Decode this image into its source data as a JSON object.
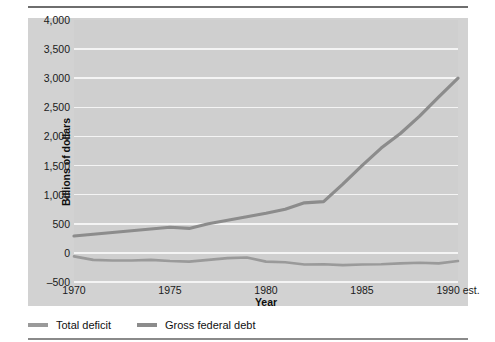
{
  "figure": {
    "background": "#ffffff",
    "panel_color": "#d2d2d2",
    "plot_color": "#cfcfcf",
    "gridline_color": "#f4f4f4",
    "rule_color": "#6e6e6e"
  },
  "chart_data": {
    "type": "line",
    "title": "",
    "subtitle": "",
    "xlabel": "Year",
    "ylabel": "Billions of dollars",
    "xlim": [
      1970,
      1990
    ],
    "ylim": [
      -500,
      4000
    ],
    "grid": true,
    "legend_position": "bottom-left",
    "yticks": [
      4000,
      3500,
      3000,
      2500,
      2000,
      1500,
      1000,
      500,
      0,
      -500
    ],
    "ytick_labels": [
      "4,000",
      "3,500",
      "3,000",
      "2,500",
      "2,000",
      "1,500",
      "1,000",
      "500",
      "0",
      "–500"
    ],
    "xticks": [
      1970,
      1975,
      1980,
      1985,
      1990
    ],
    "xtick_labels": [
      "1970",
      "1975",
      "1980",
      "1985",
      "1990 est."
    ],
    "x": [
      1970,
      1971,
      1972,
      1973,
      1974,
      1975,
      1976,
      1977,
      1978,
      1979,
      1980,
      1981,
      1982,
      1983,
      1984,
      1985,
      1986,
      1987,
      1988,
      1989,
      1990
    ],
    "series": [
      {
        "name": "Total deficit",
        "color": "#9a9a9a",
        "width": 2.6,
        "values": [
          -60,
          -120,
          -130,
          -130,
          -120,
          -140,
          -150,
          -120,
          -90,
          -80,
          -150,
          -160,
          -200,
          -195,
          -210,
          -200,
          -195,
          -180,
          -170,
          -180,
          -140
        ]
      },
      {
        "name": "Gross federal debt",
        "color": "#8c8c8c",
        "width": 3.2,
        "values": [
          290,
          320,
          350,
          380,
          410,
          440,
          420,
          500,
          560,
          620,
          680,
          750,
          860,
          880,
          1180,
          1500,
          1800,
          2050,
          2350,
          2680,
          3000
        ]
      }
    ]
  },
  "legend": {
    "items": [
      {
        "label": "Total deficit",
        "color": "#9a9a9a"
      },
      {
        "label": "Gross federal debt",
        "color": "#8c8c8c"
      }
    ]
  }
}
